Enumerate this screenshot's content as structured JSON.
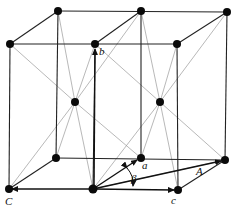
{
  "diagram": {
    "labels": {
      "b": "b",
      "a": "a",
      "c": "c",
      "C": "C",
      "A": "A",
      "beta": "β"
    },
    "atoms": {
      "back_top": [
        [
          58,
          11
        ],
        [
          141,
          11
        ],
        [
          227,
          12
        ]
      ],
      "front_top": [
        [
          10,
          44
        ],
        [
          95,
          44
        ],
        [
          177,
          44
        ]
      ],
      "body_center": [
        [
          75,
          102
        ],
        [
          160,
          102
        ]
      ],
      "back_bottom": [
        [
          56,
          158
        ],
        [
          141,
          158
        ],
        [
          225,
          160
        ]
      ],
      "front_bottom": [
        [
          9,
          189
        ],
        [
          93,
          189
        ],
        [
          178,
          190
        ]
      ]
    },
    "colors": {
      "edge": "#222222",
      "diagonal": "#9a9a9a",
      "atom": "#0a0a0a"
    }
  }
}
